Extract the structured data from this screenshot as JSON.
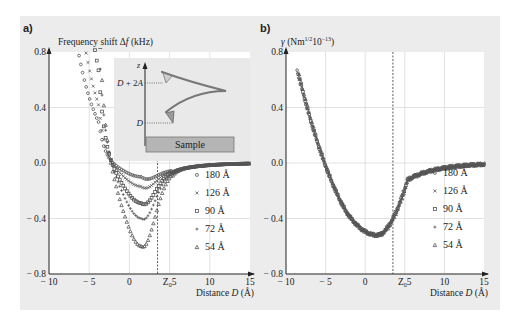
{
  "figure": {
    "background": "#ececec",
    "plot_bg": "#ffffff",
    "grid_color": "#d6d6d6",
    "marker_color": "#555555"
  },
  "chart_data": [
    {
      "panel": "a)",
      "type": "scatter",
      "title": "",
      "ylabel": "Frequency shift Δf (kHz)",
      "xlabel": "Distance D (Å)",
      "xlim": [
        -10,
        15
      ],
      "ylim": [
        -0.8,
        0.8
      ],
      "xticks": [
        "-10",
        "-5",
        "0",
        "Z₀5",
        "10",
        "15"
      ],
      "yticks": [
        "0.8",
        "0.4",
        "0.0",
        "-0.4",
        "-0.8"
      ],
      "grid": true,
      "vline": {
        "x": 3.5,
        "label": "Z₀",
        "style": "dashed"
      },
      "legend_position": "right-center",
      "series": [
        {
          "name": "180 Å",
          "marker": "circle",
          "min_y": -0.1,
          "min_x": 1.5,
          "y_at_xmin": 0.28
        },
        {
          "name": "126 Å",
          "marker": "cross",
          "min_y": -0.17,
          "min_x": 1.5,
          "y_at_xmin": 0.42
        },
        {
          "name": "90 Å",
          "marker": "square",
          "min_y": -0.29,
          "min_x": 1.5,
          "y_at_xmin": 0.7
        },
        {
          "name": "72 Å",
          "marker": "plus",
          "min_y": -0.4,
          "min_x": 1.5,
          "y_at_xmin": 0.95
        },
        {
          "name": "54 Å",
          "marker": "triangle",
          "min_y": -0.6,
          "min_x": 1.5,
          "y_at_xmin": 1.2
        }
      ],
      "inset": {
        "axis_label": "z",
        "labels": [
          "D + 2A",
          "D"
        ],
        "box_label": "Sample"
      }
    },
    {
      "panel": "b)",
      "type": "scatter",
      "ylabel": "γ (Nm^1/2 10^-13)",
      "xlabel": "Distance D (Å)",
      "xlim": [
        -10,
        15
      ],
      "ylim": [
        -0.8,
        0.8
      ],
      "xticks": [
        "-10",
        "-5",
        "0",
        "Z₀5",
        "10",
        "15"
      ],
      "yticks": [
        "0.8",
        "0.4",
        "0.0",
        "-0.4",
        "-0.8"
      ],
      "grid": true,
      "vline": {
        "x": 3.5,
        "label": "Z₀",
        "style": "dashed"
      },
      "legend_position": "right-center",
      "series": [
        {
          "name": "180 Å",
          "marker": "circle"
        },
        {
          "name": "126 Å",
          "marker": "cross"
        },
        {
          "name": "90 Å",
          "marker": "square"
        },
        {
          "name": "72 Å",
          "marker": "plus"
        },
        {
          "name": "54 Å",
          "marker": "triangle"
        }
      ],
      "collapsed_curve": {
        "min_y": -0.52,
        "min_x": 1.5,
        "y_at_x_-8.5": 0.8,
        "y_at_xmax": 0.0
      }
    }
  ]
}
